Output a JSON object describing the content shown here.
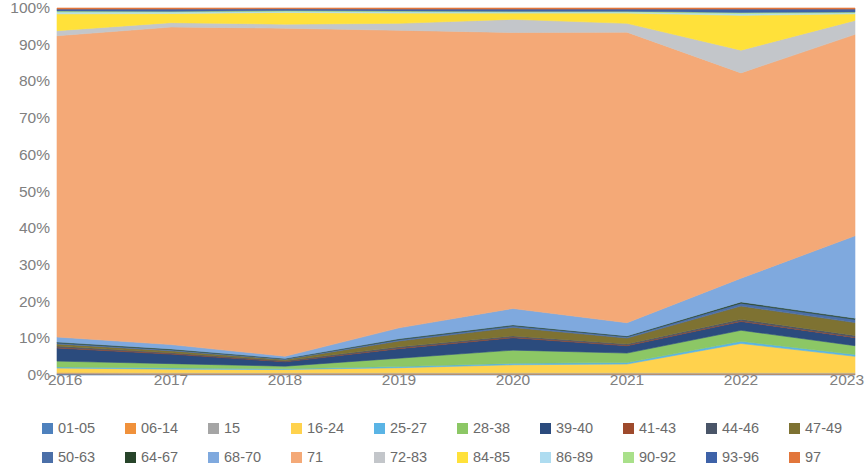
{
  "chart_data": {
    "type": "area",
    "stacked": true,
    "normalized": true,
    "title": "",
    "xlabel": "",
    "ylabel": "",
    "grid": false,
    "legend_position": "bottom",
    "categories": [
      "2016",
      "2017",
      "2018",
      "2019",
      "2020",
      "2021",
      "2022",
      "2023"
    ],
    "x": [
      2016,
      2017,
      2018,
      2019,
      2020,
      2021,
      2022,
      2023
    ],
    "ylim": [
      0,
      100
    ],
    "y_ticks": [
      "0%",
      "10%",
      "20%",
      "30%",
      "40%",
      "50%",
      "60%",
      "70%",
      "80%",
      "90%",
      "100%"
    ],
    "y_tick_values": [
      0,
      10,
      20,
      30,
      40,
      50,
      60,
      70,
      80,
      90,
      100
    ],
    "series": [
      {
        "name": "01-05",
        "color": "#4E81BD",
        "values": [
          0.3,
          0.2,
          0.2,
          0.2,
          0.2,
          0.2,
          0.2,
          0.2
        ]
      },
      {
        "name": "06-14",
        "color": "#F0913B",
        "values": [
          0.2,
          0.2,
          0.2,
          0.2,
          0.2,
          0.2,
          0.2,
          0.2
        ]
      },
      {
        "name": "15",
        "color": "#A5A5A5",
        "values": [
          0.2,
          0.2,
          0.2,
          0.2,
          0.2,
          0.2,
          0.2,
          0.2
        ]
      },
      {
        "name": "16-24",
        "color": "#FFD24D",
        "values": [
          1.2,
          1.0,
          0.9,
          1.4,
          2.2,
          2.4,
          8.0,
          4.5
        ]
      },
      {
        "name": "25-27",
        "color": "#5AB4E5",
        "values": [
          0.3,
          0.3,
          0.2,
          0.3,
          0.4,
          0.4,
          0.6,
          0.5
        ]
      },
      {
        "name": "28-38",
        "color": "#8CC765",
        "values": [
          1.6,
          1.2,
          0.7,
          2.3,
          3.6,
          2.6,
          3.0,
          2.4
        ]
      },
      {
        "name": "39-40",
        "color": "#2B4B7D",
        "values": [
          3.6,
          2.6,
          1.2,
          2.6,
          3.4,
          2.0,
          2.4,
          2.2
        ]
      },
      {
        "name": "41-43",
        "color": "#9E4A2C",
        "values": [
          0.2,
          0.2,
          0.1,
          0.2,
          0.2,
          0.2,
          0.2,
          0.2
        ]
      },
      {
        "name": "44-46",
        "color": "#4A5568",
        "values": [
          0.3,
          0.2,
          0.2,
          0.3,
          0.3,
          0.3,
          0.4,
          0.4
        ]
      },
      {
        "name": "47-49",
        "color": "#7E7232",
        "values": [
          0.6,
          0.5,
          0.3,
          1.6,
          2.3,
          1.6,
          3.6,
          3.5
        ]
      },
      {
        "name": "50-63",
        "color": "#4B6FA8",
        "values": [
          0.3,
          0.3,
          0.2,
          0.4,
          0.5,
          0.4,
          0.8,
          0.9
        ]
      },
      {
        "name": "64-67",
        "color": "#27442A",
        "values": [
          0.2,
          0.2,
          0.1,
          0.2,
          0.2,
          0.2,
          0.3,
          0.3
        ]
      },
      {
        "name": "68-70",
        "color": "#7FA9DE",
        "values": [
          1.4,
          1.2,
          0.6,
          3.0,
          4.5,
          3.6,
          6.5,
          22.5
        ]
      },
      {
        "name": "71",
        "color": "#F4A977",
        "values": [
          82.4,
          86.6,
          89.5,
          81.4,
          75.5,
          79.5,
          56.0,
          55.0
        ]
      },
      {
        "name": "72-83",
        "color": "#C3C6CA",
        "values": [
          1.4,
          1.2,
          1.1,
          1.9,
          3.6,
          2.4,
          6.2,
          3.8
        ]
      },
      {
        "name": "84-85",
        "color": "#FFE13A",
        "values": [
          4.6,
          2.5,
          3.2,
          2.8,
          1.7,
          2.8,
          9.5,
          1.8
        ]
      },
      {
        "name": "86-89",
        "color": "#AEDCF0",
        "values": [
          0.5,
          0.4,
          0.3,
          0.4,
          0.3,
          0.3,
          0.5,
          0.3
        ]
      },
      {
        "name": "90-92",
        "color": "#A9E08A",
        "values": [
          0.3,
          0.2,
          0.2,
          0.2,
          0.2,
          0.2,
          0.3,
          0.2
        ]
      },
      {
        "name": "93-96",
        "color": "#3E62A8",
        "values": [
          0.5,
          0.6,
          0.5,
          0.5,
          0.6,
          0.6,
          0.9,
          0.8
        ]
      },
      {
        "name": "97",
        "color": "#E2763B",
        "values": [
          0.3,
          0.3,
          0.2,
          0.3,
          0.3,
          0.3,
          0.3,
          0.3
        ]
      }
    ]
  },
  "axes": {
    "y_ticks": [
      {
        "label": "100%",
        "value": 100
      },
      {
        "label": "90%",
        "value": 90
      },
      {
        "label": "80%",
        "value": 80
      },
      {
        "label": "70%",
        "value": 70
      },
      {
        "label": "60%",
        "value": 60
      },
      {
        "label": "50%",
        "value": 50
      },
      {
        "label": "40%",
        "value": 40
      },
      {
        "label": "30%",
        "value": 30
      },
      {
        "label": "20%",
        "value": 20
      },
      {
        "label": "10%",
        "value": 10
      },
      {
        "label": "0%",
        "value": 0
      }
    ],
    "x_ticks": [
      {
        "label": "2016"
      },
      {
        "label": "2017"
      },
      {
        "label": "2018"
      },
      {
        "label": "2019"
      },
      {
        "label": "2020"
      },
      {
        "label": "2021"
      },
      {
        "label": "2022"
      },
      {
        "label": "2023"
      }
    ]
  },
  "legend": {
    "rows": [
      [
        {
          "label": "01-05",
          "color": "#4E81BD"
        },
        {
          "label": "06-14",
          "color": "#F0913B"
        },
        {
          "label": "15",
          "color": "#A5A5A5"
        },
        {
          "label": "16-24",
          "color": "#FFD24D"
        },
        {
          "label": "25-27",
          "color": "#5AB4E5"
        },
        {
          "label": "28-38",
          "color": "#8CC765"
        },
        {
          "label": "39-40",
          "color": "#2B4B7D"
        },
        {
          "label": "41-43",
          "color": "#9E4A2C"
        },
        {
          "label": "44-46",
          "color": "#4A5568"
        },
        {
          "label": "47-49",
          "color": "#7E7232"
        }
      ],
      [
        {
          "label": "50-63",
          "color": "#4B6FA8"
        },
        {
          "label": "64-67",
          "color": "#27442A"
        },
        {
          "label": "68-70",
          "color": "#7FA9DE"
        },
        {
          "label": "71",
          "color": "#F4A977"
        },
        {
          "label": "72-83",
          "color": "#C3C6CA"
        },
        {
          "label": "84-85",
          "color": "#FFE13A"
        },
        {
          "label": "86-89",
          "color": "#AEDCF0"
        },
        {
          "label": "90-92",
          "color": "#A9E08A"
        },
        {
          "label": "93-96",
          "color": "#3E62A8"
        },
        {
          "label": "97",
          "color": "#E2763B"
        }
      ]
    ]
  }
}
